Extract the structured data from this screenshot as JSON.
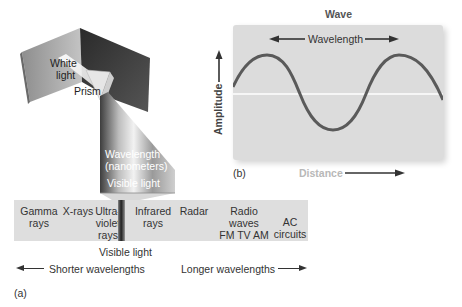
{
  "prism_figure": {
    "white_light_label": [
      "White",
      "light"
    ],
    "prism_label": "Prism",
    "wavelength_label": [
      "Wavelength",
      "(nanometers)"
    ],
    "visible_light_label": "Visible light"
  },
  "wave_figure": {
    "title": "Wave",
    "wavelength_label": "Wavelength",
    "amplitude_label": "Amplitude",
    "distance_label": "Distance",
    "panel_tag": "(b)",
    "colors": {
      "panel": "#dcdcdc",
      "wave_line": "#5a5a5a",
      "axis_line": "#ffffff"
    }
  },
  "spectrum": {
    "items": [
      {
        "id": "gamma",
        "lines": [
          "Gamma",
          "rays"
        ]
      },
      {
        "id": "xrays",
        "lines": [
          "X-rays"
        ]
      },
      {
        "id": "ultraviolet",
        "lines": [
          "Ultra-",
          "violet",
          "rays"
        ]
      },
      {
        "id": "infrared",
        "lines": [
          "Infrared",
          "rays"
        ]
      },
      {
        "id": "radar",
        "lines": [
          "Radar"
        ]
      },
      {
        "id": "radio",
        "lines": [
          "Radio waves",
          "FM TV AM"
        ]
      },
      {
        "id": "ac",
        "lines": [
          "AC",
          "circuits"
        ]
      }
    ],
    "visible_light_label": "Visible light",
    "shorter_label": "Shorter wavelengths",
    "longer_label": "Longer wavelengths",
    "panel_tag": "(a)"
  }
}
